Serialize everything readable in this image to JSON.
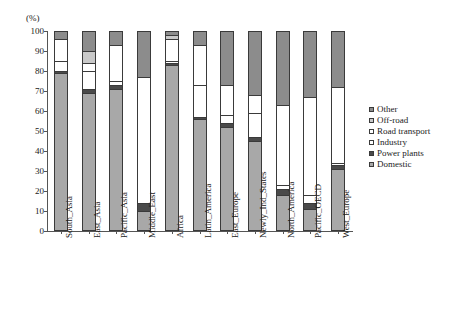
{
  "chart_data": {
    "type": "bar",
    "subtype": "stacked-100-percent",
    "title": "",
    "xlabel": "",
    "ylabel": "(%)",
    "y_unit_label": "(%)",
    "ylim": [
      0,
      100
    ],
    "ytick_labels": [
      "0",
      "10",
      "20",
      "30",
      "40",
      "50",
      "60",
      "70",
      "80",
      "90",
      "100"
    ],
    "ytick_values": [
      0,
      10,
      20,
      30,
      40,
      50,
      60,
      70,
      80,
      90,
      100
    ],
    "grid": false,
    "legend_position": "right",
    "legend_order_top_to_bottom": [
      "Other",
      "Off-road",
      "Road transport",
      "Industry",
      "Power plants",
      "Domestic"
    ],
    "stack_order_bottom_to_top": [
      "Domestic",
      "Power plants",
      "Industry",
      "Road transport",
      "Off-road",
      "Other"
    ],
    "categories": [
      "South_Asia",
      "East_Asia",
      "Pacific_Asia",
      "Middle_East",
      "Africa",
      "Latin_America",
      "East_Europe",
      "Newly_Ind_States",
      "North_America",
      "Pacific_OECD",
      "West_Europe"
    ],
    "series": [
      {
        "name": "Domestic",
        "color": "#a8a8a8",
        "values": [
          79,
          69,
          71,
          10,
          83,
          56,
          52,
          45,
          18,
          11,
          31
        ]
      },
      {
        "name": "Power plants",
        "color": "#4a4a4a",
        "values": [
          1,
          2,
          2,
          4,
          1,
          1,
          2,
          2,
          3,
          3,
          2
        ]
      },
      {
        "name": "Industry",
        "color": "#ffffff",
        "values": [
          5,
          9,
          2,
          63,
          1,
          16,
          4,
          12,
          2,
          4,
          1
        ]
      },
      {
        "name": "Road transport",
        "color": "#ffffff",
        "values": [
          11,
          4,
          18,
          0,
          11,
          20,
          15,
          9,
          40,
          49,
          38
        ]
      },
      {
        "name": "Off-road",
        "color": "#c9c9c9",
        "values": [
          0,
          6,
          0,
          0,
          2,
          0,
          0,
          0,
          0,
          0,
          0
        ]
      },
      {
        "name": "Other",
        "color": "#8c8c8c",
        "values": [
          4,
          10,
          7,
          23,
          2,
          7,
          27,
          32,
          37,
          33,
          28
        ]
      }
    ]
  },
  "legend": {
    "items": [
      {
        "label": "Other",
        "swatch_class": "sw-other",
        "name": "legend-item-other"
      },
      {
        "label": "Off-road",
        "swatch_class": "sw-offroad",
        "name": "legend-item-off-road"
      },
      {
        "label": "Road transport",
        "swatch_class": "sw-road",
        "name": "legend-item-road-transport"
      },
      {
        "label": "Industry",
        "swatch_class": "sw-industry",
        "name": "legend-item-industry"
      },
      {
        "label": "Power plants",
        "swatch_class": "sw-power",
        "name": "legend-item-power-plants"
      },
      {
        "label": "Domestic",
        "swatch_class": "sw-domestic",
        "name": "legend-item-domestic"
      }
    ]
  },
  "colors": {
    "domestic": "#a8a8a8",
    "power_plants": "#4a4a4a",
    "industry": "#ffffff",
    "road_transport": "#ffffff",
    "off_road": "#c9c9c9",
    "other": "#8c8c8c",
    "axis": "#555555",
    "outline": "#3a3a3a",
    "background": "#ffffff"
  }
}
